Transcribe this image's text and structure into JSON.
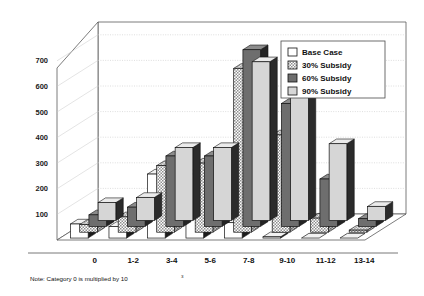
{
  "chart_data": {
    "type": "bar",
    "title": "",
    "subtitle": "",
    "xlabel": "",
    "ylabel": "",
    "projection": "3d-grouped-depth",
    "grid": true,
    "legend_position": "top-right",
    "ylim": [
      0,
      750
    ],
    "yticks": [
      100,
      200,
      300,
      400,
      500,
      600,
      700
    ],
    "ytick_labels": [
      "100",
      "200",
      "300",
      "400",
      "500",
      "600",
      "700"
    ],
    "categories": [
      "0",
      "1-2",
      "3-4",
      "5-6",
      "7-8",
      "9-10",
      "11-12",
      "13-14"
    ],
    "series": [
      {
        "name": "Base Case",
        "fill": "white",
        "values": [
          55,
          45,
          250,
          250,
          60,
          5,
          0,
          0
        ]
      },
      {
        "name": "30% Subsidy",
        "fill": "hatch",
        "values": [
          30,
          60,
          260,
          270,
          640,
          380,
          55,
          8
        ]
      },
      {
        "name": "60% Subsidy",
        "fill": "darkgray",
        "values": [
          45,
          75,
          275,
          275,
          690,
          480,
          185,
          30
        ]
      },
      {
        "name": "90% Subsidy",
        "fill": "lightgray",
        "values": [
          70,
          90,
          285,
          285,
          620,
          660,
          300,
          55
        ]
      }
    ],
    "annotations": [
      "Note: Category 0 is multiplied by 10"
    ],
    "note": {
      "text": "Note: Category 0 is multiplied by 10",
      "superscript": "3"
    },
    "legend_entries": [
      "Base Case",
      "30% Subsidy",
      "60% Subsidy",
      "90% Subsidy"
    ],
    "colors": {
      "base_case": "#ffffff",
      "subsidy_30": "#c9c9c9",
      "subsidy_60": "#707070",
      "subsidy_90": "#d9d9d9",
      "axis": "#555555",
      "text": "#111111"
    }
  }
}
